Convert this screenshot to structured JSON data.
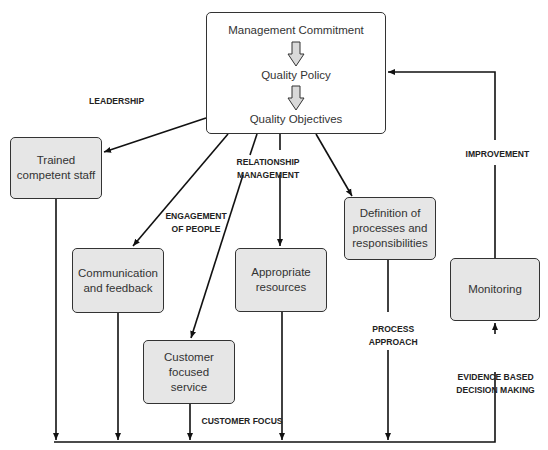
{
  "top_box": {
    "items": [
      "Management Commitment",
      "Quality Policy",
      "Quality Objectives"
    ]
  },
  "boxes": {
    "trained_staff": "Trained competent staff",
    "communication": "Communication and feedback",
    "customer_service": "Customer focused service",
    "resources": "Appropriate resources",
    "processes": "Definition of processes and responsibilities",
    "monitoring": "Monitoring"
  },
  "labels": {
    "leadership": "LEADERSHIP",
    "relationship_1": "RELATIONSHIP",
    "relationship_2": "MANAGEMENT",
    "engagement_1": "ENGAGEMENT",
    "engagement_2": "OF PEOPLE",
    "improvement": "IMPROVEMENT",
    "process_1": "PROCESS",
    "process_2": "APPROACH",
    "evidence_1": "EVIDENCE BASED",
    "evidence_2": "DECISION MAKING",
    "customer_focus": "CUSTOMER FOCUS"
  },
  "colors": {
    "box_fill": "#e6e6e6",
    "line": "#111111",
    "text": "#333333"
  }
}
